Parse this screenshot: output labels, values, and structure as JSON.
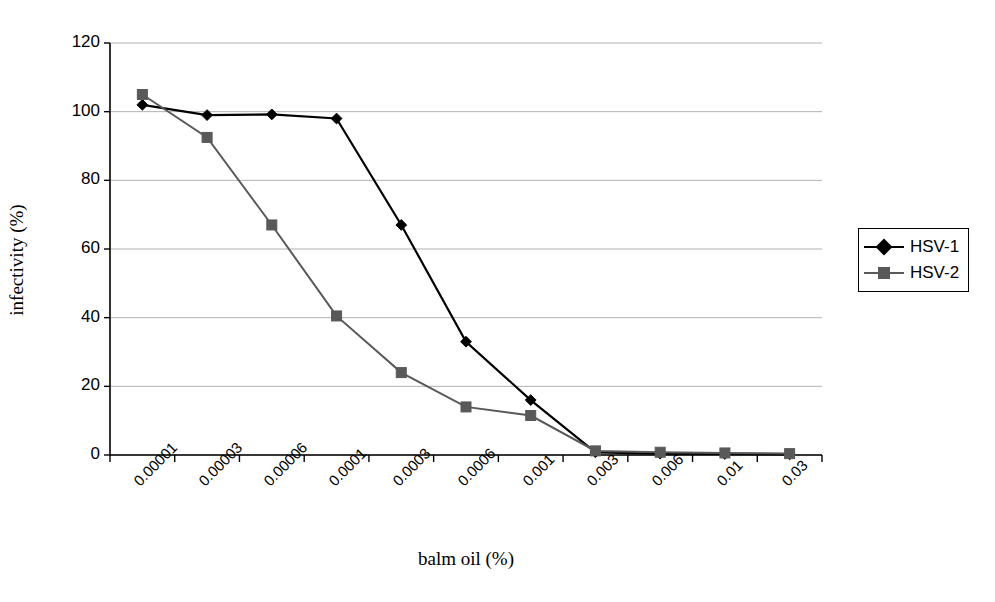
{
  "chart_data": {
    "type": "line",
    "title": "",
    "xlabel": "balm oil (%)",
    "ylabel": "infectivity (%)",
    "categories": [
      "0.00001",
      "0.00003",
      "0.00006",
      "0.0001",
      "0.0003",
      "0.0006",
      "0.001",
      "0.003",
      "0.006",
      "0.01",
      "0.03"
    ],
    "ylim": [
      0,
      120
    ],
    "yticks": [
      0,
      20,
      40,
      60,
      80,
      100,
      120
    ],
    "grid": "horizontal",
    "legend_position": "right",
    "series": [
      {
        "name": "HSV-1",
        "color": "#000000",
        "marker": "diamond",
        "values": [
          102,
          99,
          99.2,
          98,
          67,
          33,
          16,
          0.8,
          0.4,
          0.3,
          0.2
        ]
      },
      {
        "name": "HSV-2",
        "color": "#595959",
        "marker": "square",
        "values": [
          105,
          92.5,
          67,
          40.5,
          24,
          14,
          11.5,
          1.2,
          0.8,
          0.6,
          0.4
        ]
      }
    ]
  },
  "axes": {
    "y_tick_labels": [
      "120",
      "100",
      "80",
      "60",
      "40",
      "20",
      "0"
    ],
    "x_tick_labels": [
      "0.00001",
      "0.00003",
      "0.00006",
      "0.0001",
      "0.0003",
      "0.0006",
      "0.001",
      "0.003",
      "0.006",
      "0.01",
      "0.03"
    ]
  },
  "legend": {
    "items": [
      {
        "label": "HSV-1"
      },
      {
        "label": "HSV-2"
      }
    ]
  },
  "colors": {
    "series1": "#000000",
    "series2": "#595959",
    "grid": "#b0b0b0",
    "axis": "#000000",
    "background": "#ffffff"
  }
}
